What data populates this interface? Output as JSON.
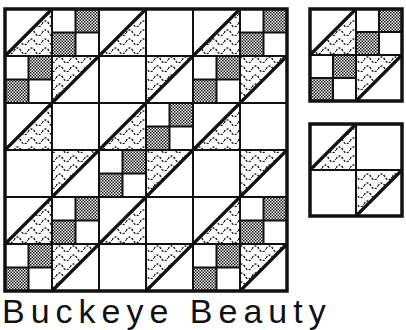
{
  "caption": "Buckeye Beauty",
  "colors": {
    "ink": "#111111",
    "paper": "#ffffff"
  },
  "legend": {
    "A": "half-square triangle: white upper-left, wavy lower-right",
    "B": "half-square triangle: wavy upper-left, white lower-right",
    "F": "four-patch: white/dotted checker",
    "P": "plain white square"
  },
  "quilt": {
    "x": 5,
    "y": 9,
    "cell": 47,
    "rows": 6,
    "cols": 6,
    "grid": [
      [
        "A",
        "F",
        "A",
        "P",
        "A",
        "F"
      ],
      [
        "F",
        "B",
        "P",
        "B",
        "F",
        "B"
      ],
      [
        "A",
        "P",
        "A",
        "F",
        "A",
        "P"
      ],
      [
        "P",
        "B",
        "F",
        "B",
        "P",
        "B"
      ],
      [
        "A",
        "F",
        "A",
        "P",
        "A",
        "F"
      ],
      [
        "F",
        "B",
        "P",
        "B",
        "F",
        "B"
      ]
    ]
  },
  "blocks": [
    {
      "name": "block-buckeye-unit",
      "x": 310,
      "y": 9,
      "cell": 46,
      "grid": [
        [
          "A",
          "F"
        ],
        [
          "F",
          "B"
        ]
      ]
    },
    {
      "name": "block-triangle-unit",
      "x": 310,
      "y": 124,
      "cell": 46,
      "grid": [
        [
          "A",
          "P"
        ],
        [
          "P",
          "B"
        ]
      ]
    }
  ]
}
